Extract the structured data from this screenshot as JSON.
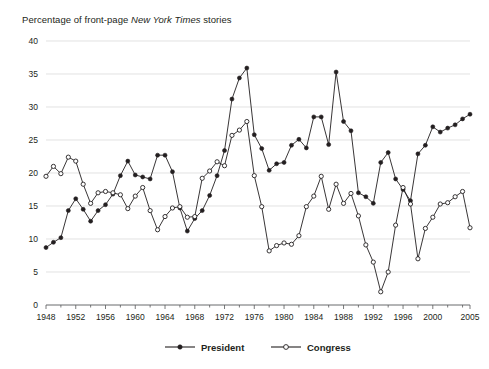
{
  "chart_data": {
    "type": "line",
    "title": "Percentage of front-page New York Times stories",
    "title_parts": {
      "before": "Percentage of front-page ",
      "italic": "New York Times",
      "after": " stories"
    },
    "xlabel": "",
    "ylabel": "",
    "xlim": [
      1948,
      2005
    ],
    "ylim": [
      0,
      40
    ],
    "y_ticks": [
      0,
      5,
      10,
      15,
      20,
      25,
      30,
      35,
      40
    ],
    "x_ticks": [
      1948,
      1952,
      1956,
      1960,
      1964,
      1968,
      1972,
      1976,
      1980,
      1984,
      1988,
      1992,
      1996,
      2000,
      2005
    ],
    "grid": true,
    "grid_axis": "y",
    "legend_position": "bottom",
    "x": [
      1948,
      1949,
      1950,
      1951,
      1952,
      1953,
      1954,
      1955,
      1956,
      1957,
      1958,
      1959,
      1960,
      1961,
      1962,
      1963,
      1964,
      1965,
      1966,
      1967,
      1968,
      1969,
      1970,
      1971,
      1972,
      1973,
      1974,
      1975,
      1976,
      1977,
      1978,
      1979,
      1980,
      1981,
      1982,
      1983,
      1984,
      1985,
      1986,
      1987,
      1988,
      1989,
      1990,
      1991,
      1992,
      1993,
      1994,
      1995,
      1996,
      1997,
      1998,
      1999,
      2000,
      2001,
      2002,
      2003,
      2004,
      2005
    ],
    "series": [
      {
        "name": "President",
        "marker": "filled-circle",
        "color": "#231f20",
        "values": [
          8.7,
          9.5,
          10.2,
          14.3,
          16.1,
          14.5,
          12.7,
          14.3,
          15.2,
          16.8,
          19.6,
          21.8,
          19.7,
          19.4,
          19.1,
          22.7,
          22.7,
          20.2,
          14.7,
          11.2,
          13.1,
          14.3,
          16.6,
          19.6,
          23.4,
          31.2,
          34.4,
          35.9,
          25.8,
          23.7,
          20.4,
          21.4,
          21.6,
          24.2,
          25.1,
          23.8,
          28.5,
          28.5,
          24.3,
          35.3,
          27.8,
          26.4,
          17.0,
          16.4,
          15.4,
          21.6,
          23.1,
          19.1,
          17.5,
          15.8,
          22.9,
          24.2,
          27.0,
          26.2,
          26.8,
          27.3,
          28.2,
          28.9
        ]
      },
      {
        "name": "Congress",
        "marker": "open-circle",
        "color": "#ffffff",
        "values": [
          19.5,
          21.0,
          19.9,
          22.4,
          21.8,
          18.3,
          15.4,
          17.0,
          17.2,
          17.0,
          16.7,
          14.6,
          16.5,
          17.8,
          14.3,
          11.4,
          13.4,
          14.7,
          14.9,
          13.3,
          13.4,
          19.2,
          20.3,
          21.7,
          21.1,
          25.7,
          26.5,
          27.8,
          19.6,
          14.9,
          8.2,
          9.0,
          9.4,
          9.2,
          10.5,
          14.9,
          16.5,
          19.5,
          14.5,
          18.3,
          15.4,
          16.9,
          13.5,
          9.1,
          6.5,
          2.0,
          5.0,
          12.1,
          17.8,
          15.3,
          7.0,
          11.6,
          13.3,
          15.3,
          15.5,
          16.4,
          17.2,
          11.7
        ]
      }
    ]
  },
  "legend": {
    "items": [
      {
        "label": "President",
        "marker": "filled-circle"
      },
      {
        "label": "Congress",
        "marker": "open-circle"
      }
    ]
  }
}
